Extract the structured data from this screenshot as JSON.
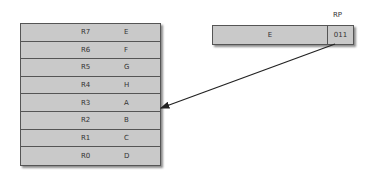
{
  "register_file": {
    "rows": [
      {
        "name": "R7",
        "value": "E"
      },
      {
        "name": "R6",
        "value": "F"
      },
      {
        "name": "R5",
        "value": "G"
      },
      {
        "name": "R4",
        "value": "H"
      },
      {
        "name": "R3",
        "value": "A"
      },
      {
        "name": "R2",
        "value": "B"
      },
      {
        "name": "R1",
        "value": "C"
      },
      {
        "name": "R0",
        "value": "D"
      }
    ]
  },
  "rp": {
    "label": "RP",
    "value": "E",
    "pointer": "011"
  },
  "arrow": {
    "from": "rp.pointer",
    "to": "R3"
  }
}
